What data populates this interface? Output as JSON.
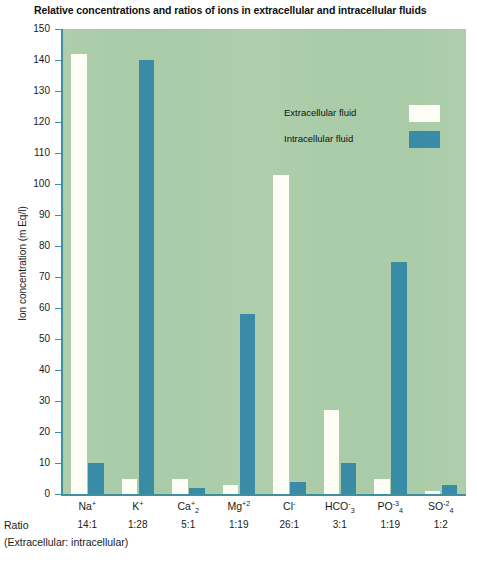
{
  "chart_data": {
    "type": "bar",
    "title": "Relative concentrations and ratios of ions in extracellular and intracellular fluids",
    "xlabel": "",
    "ylabel": "Ion concentration (m Eq/l)",
    "ylim": [
      0,
      150
    ],
    "ytick_step": 10,
    "grid": false,
    "legend_position": "inside-top-center",
    "categories": [
      "Na+",
      "K+",
      "Ca+2",
      "Mg+2",
      "Cl-",
      "HCO3-",
      "PO4-3",
      "SO4-2"
    ],
    "series": [
      {
        "name": "Extracellular fluid",
        "color": "#fdfdf6",
        "values": [
          142,
          5,
          5,
          3,
          103,
          27,
          5,
          1
        ]
      },
      {
        "name": "Intracellular fluid",
        "color": "#3a8ba5",
        "values": [
          10,
          140,
          2,
          58,
          4,
          10,
          75,
          3
        ]
      }
    ],
    "ytick_labels": [
      "150",
      "140",
      "130",
      "120",
      "110",
      "100",
      "90",
      "80",
      "70",
      "60",
      "50",
      "40",
      "30",
      "20",
      "10",
      "0"
    ],
    "ion_labels": [
      {
        "base": "Na",
        "sup": "+",
        "sub": ""
      },
      {
        "base": "K",
        "sup": "+",
        "sub": ""
      },
      {
        "base": "Ca",
        "sup": "+",
        "sub": "2"
      },
      {
        "base": "Mg",
        "sup": "+2",
        "sub": ""
      },
      {
        "base": "Cl",
        "sup": "-",
        "sub": ""
      },
      {
        "base": "HCO",
        "sup": "-",
        "sub": "3"
      },
      {
        "base": "PO",
        "sup": "-3",
        "sub": "4"
      },
      {
        "base": "SO",
        "sup": "-2",
        "sub": "4"
      }
    ],
    "ratios": [
      "14:1",
      "1:28",
      "5:1",
      "1:19",
      "26:1",
      "3:1",
      "1:19",
      "1:2"
    ],
    "ratio_row_label": "Ratio",
    "ratio_caption": "(Extracellular: intracellular)",
    "colors": {
      "plot_background": "#a9cba7",
      "axis": "#3e8fa0",
      "extracellular": "#fdfdf6",
      "intracellular": "#3a8ba5",
      "text": "#1a1a1a"
    }
  },
  "legend": {
    "items": [
      {
        "label": "Extracellular fluid",
        "swatch": "extracellular"
      },
      {
        "label": "Intracellular fluid",
        "swatch": "intracellular"
      }
    ]
  }
}
